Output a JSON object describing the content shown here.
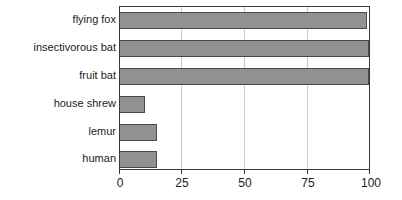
{
  "chart_data": {
    "type": "bar",
    "orientation": "horizontal",
    "title": "",
    "subtitle": "",
    "xlabel": "",
    "ylabel": "",
    "xlim": [
      0,
      100
    ],
    "xticks": [
      0,
      25,
      50,
      75,
      100
    ],
    "xtick_labels": [
      "0",
      "25",
      "50",
      "75",
      "100"
    ],
    "grid": "vertical",
    "legend": "none",
    "categories": [
      "flying fox",
      "insectivorous bat",
      "fruit bat",
      "house shrew",
      "lemur",
      "human"
    ],
    "values": [
      99,
      100,
      100,
      10,
      15,
      15
    ],
    "bar_color": "#919191",
    "bar_edge_color": "#4a4a4a",
    "axis_color": "#3a3a3a",
    "grid_color": "#c9c9c9",
    "background_color": "#ffffff"
  }
}
